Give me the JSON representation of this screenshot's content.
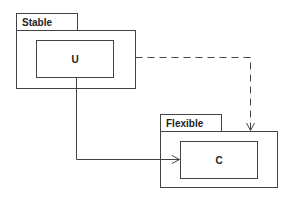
{
  "diagram": {
    "type": "uml-package-dependency",
    "packages": [
      {
        "name": "Stable",
        "classes": [
          {
            "name": "U"
          }
        ]
      },
      {
        "name": "Flexible",
        "classes": [
          {
            "name": "C"
          }
        ]
      }
    ],
    "relations": [
      {
        "from": "U",
        "to": "C",
        "style": "solid",
        "arrow": "open"
      },
      {
        "from": "Stable",
        "to": "Flexible",
        "style": "dashed",
        "arrow": "open"
      }
    ],
    "colors": {
      "stroke": "#444444",
      "text": "#222222",
      "background": "#ffffff"
    }
  }
}
